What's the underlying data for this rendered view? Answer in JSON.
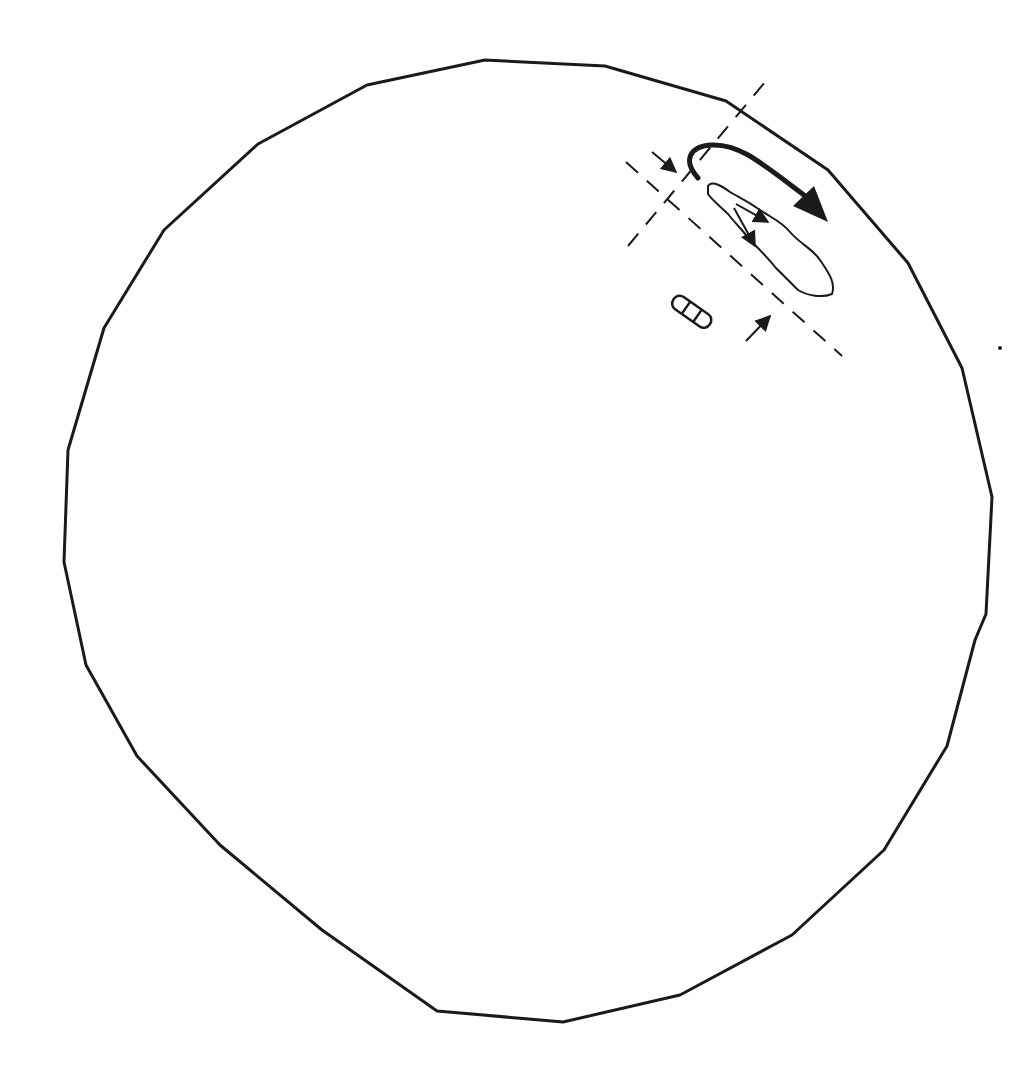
{
  "canvas": {
    "width": 1022,
    "height": 1076,
    "background": "#ffffff"
  },
  "colors": {
    "ink": "#1a1a1a"
  },
  "boundary": {
    "label": "outer polygonal boundary",
    "points": [
      [
        485,
        60
      ],
      [
        605,
        66
      ],
      [
        726,
        101
      ],
      [
        828,
        170
      ],
      [
        908,
        263
      ],
      [
        962,
        368
      ],
      [
        992,
        497
      ],
      [
        986,
        614
      ],
      [
        975,
        640
      ],
      [
        947,
        746
      ],
      [
        884,
        850
      ],
      [
        792,
        935
      ],
      [
        680,
        995
      ],
      [
        563,
        1022
      ],
      [
        437,
        1011
      ],
      [
        322,
        930
      ],
      [
        220,
        845
      ],
      [
        137,
        756
      ],
      [
        86,
        665
      ],
      [
        64,
        562
      ],
      [
        68,
        450
      ],
      [
        104,
        328
      ],
      [
        164,
        230
      ],
      [
        258,
        144
      ],
      [
        367,
        85
      ]
    ]
  },
  "dashed_lines": [
    {
      "name": "axis-long",
      "from": [
        626,
        162
      ],
      "to": [
        842,
        356
      ]
    },
    {
      "name": "axis-cross",
      "from": [
        628,
        246
      ],
      "to": [
        770,
        76
      ]
    }
  ],
  "arrows": {
    "main_flow": {
      "path": "M698,178 C682,160 690,146 712,145 C740,144 760,162 808,198",
      "head": [
        [
          793,
          206
        ],
        [
          828,
          222
        ],
        [
          814,
          186
        ]
      ]
    },
    "inflow_top": {
      "from": [
        652,
        152
      ],
      "to": [
        676,
        172
      ]
    },
    "inflow_bottom": {
      "from": [
        746,
        341
      ],
      "to": [
        770,
        316
      ]
    }
  },
  "lake": {
    "outline": "M708,186 C712,180 722,186 730,192 C740,198 746,200 760,210 C772,218 782,222 790,232 C800,244 812,248 820,260 C828,272 836,282 832,294 C822,298 808,296 798,290 C790,282 784,276 776,268 C768,258 760,250 752,242 C744,232 736,224 728,214 C720,206 712,200 708,194 Z",
    "inner_arrows": [
      {
        "from": [
          736,
          204
        ],
        "to": [
          768,
          222
        ]
      },
      {
        "from": [
          734,
          208
        ],
        "to": [
          755,
          246
        ]
      }
    ]
  },
  "boat_icon": {
    "x": 678,
    "y": 293
  },
  "stray_dot": {
    "x": 1000,
    "y": 348
  }
}
